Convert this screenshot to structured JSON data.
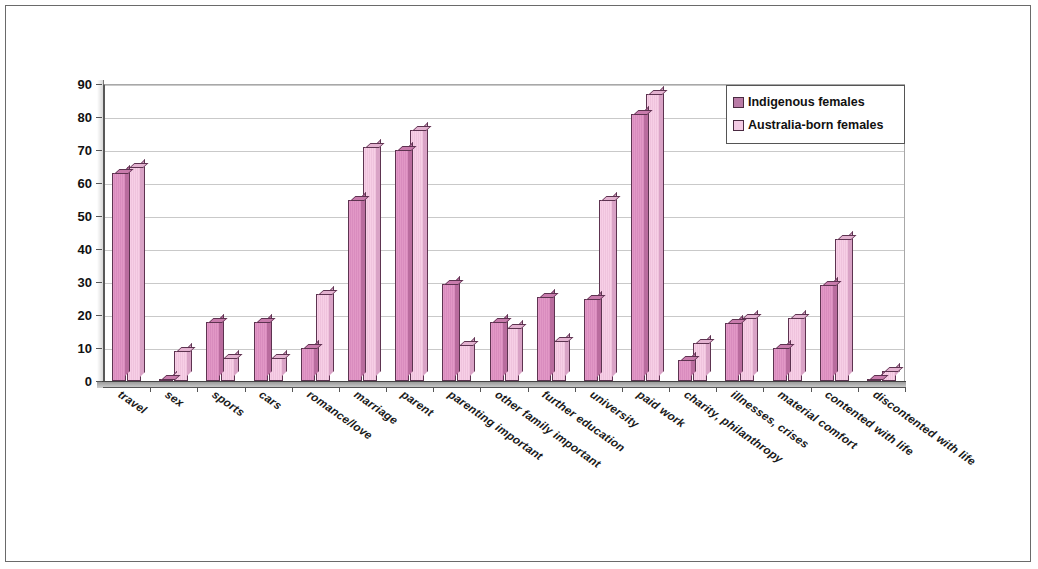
{
  "chart_data": {
    "type": "bar",
    "title": "",
    "xlabel": "",
    "ylabel": "",
    "ylim": [
      0,
      90
    ],
    "ytick_step": 10,
    "yticks": [
      0,
      10,
      20,
      30,
      40,
      50,
      60,
      70,
      80,
      90
    ],
    "grid": true,
    "legend_position": "top-right",
    "categories": [
      "travel",
      "sex",
      "sports",
      "cars",
      "romance/love",
      "marriage",
      "parent",
      "parenting important",
      "other family important",
      "further education",
      "university",
      "paid work",
      "charity, philanthropy",
      "illnesses, crises",
      "material comfort",
      "contented with life",
      "discontented with life"
    ],
    "series": [
      {
        "name": "Indigenous females",
        "color": "#d98cbe",
        "values": [
          63,
          0.5,
          18,
          18,
          10,
          55,
          70,
          29.5,
          18,
          25.5,
          25,
          81,
          6.5,
          17.5,
          10,
          29,
          0.5
        ]
      },
      {
        "name": "Australia-born females",
        "color": "#f3cbe4",
        "values": [
          65,
          9,
          7,
          7,
          26.5,
          71,
          76,
          11,
          16,
          12,
          55,
          87,
          11.5,
          19,
          19,
          43,
          3
        ]
      }
    ]
  },
  "legend": {
    "items": [
      {
        "label": "Indigenous females"
      },
      {
        "label": "Australia-born females"
      }
    ]
  }
}
